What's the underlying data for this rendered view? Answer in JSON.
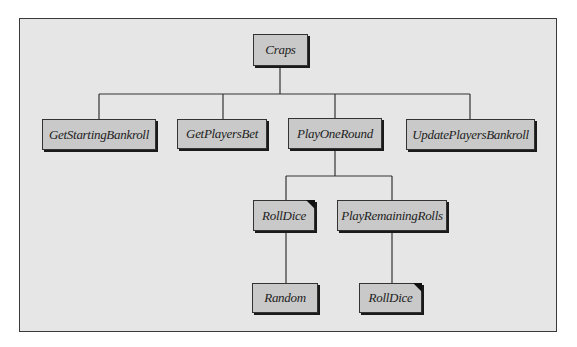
{
  "diagram": {
    "type": "structure-chart",
    "root": {
      "label": "Craps",
      "children": [
        {
          "label": "GetStartingBankroll"
        },
        {
          "label": "GetPlayersBet"
        },
        {
          "label": "PlayOneRound",
          "children": [
            {
              "label": "RollDice",
              "marked": true,
              "children": [
                {
                  "label": "Random"
                }
              ]
            },
            {
              "label": "PlayRemainingRolls",
              "children": [
                {
                  "label": "RollDice",
                  "marked": true
                }
              ]
            }
          ]
        },
        {
          "label": "UpdatePlayersBankroll"
        }
      ]
    },
    "nodes": {
      "craps": "Craps",
      "get_starting_bankroll": "GetStartingBankroll",
      "get_players_bet": "GetPlayersBet",
      "play_one_round": "PlayOneRound",
      "update_players_bankroll": "UpdatePlayersBankroll",
      "roll_dice_1": "RollDice",
      "play_remaining_rolls": "PlayRemainingRolls",
      "random": "Random",
      "roll_dice_2": "RollDice"
    },
    "colors": {
      "background": "#e6e6e6",
      "box_fill": "#c9c9c9",
      "line": "#333333",
      "marker": "#111111"
    }
  }
}
